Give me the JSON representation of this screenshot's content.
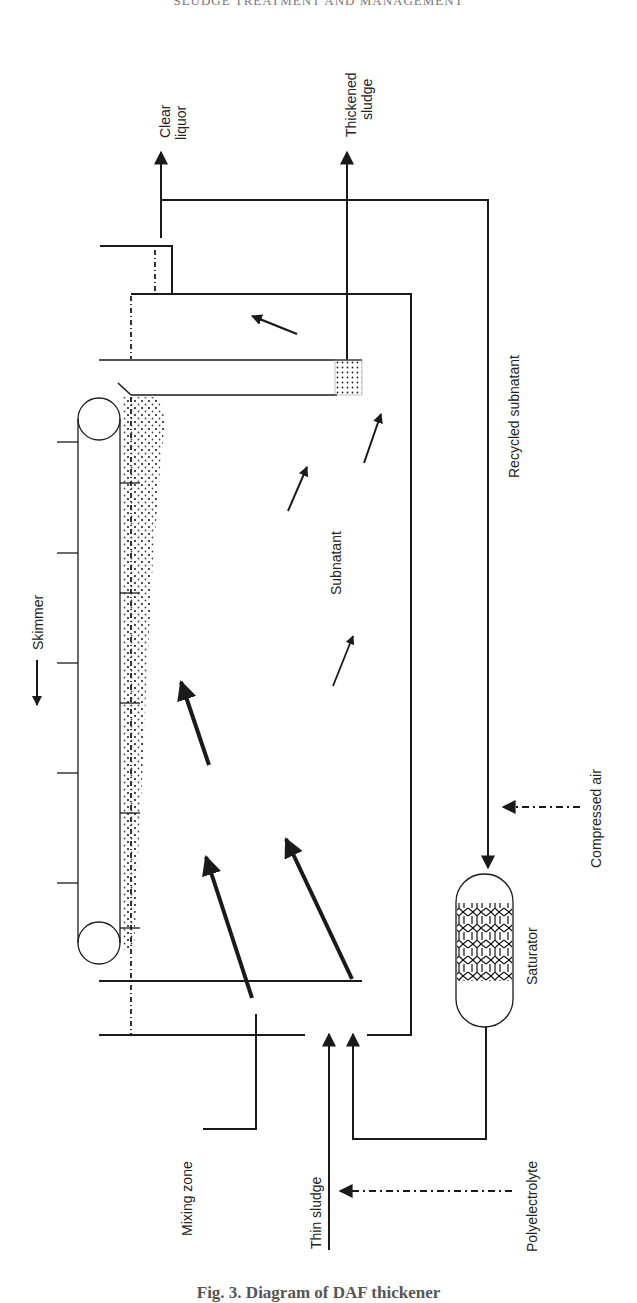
{
  "page": {
    "running_header": "SLUDGE TREATMENT AND MANAGEMENT",
    "caption": "Fig. 3. Diagram of DAF thickener"
  },
  "diagram": {
    "labels": {
      "clear_liquor_line1": "Clear",
      "clear_liquor_line2": "liquor",
      "thickened_sludge_line1": "Thickened",
      "thickened_sludge_line2": "sludge",
      "recycled_subnatant": "Recycled subnatant",
      "skimmer": "Skimmer",
      "subnatant": "Subnatant",
      "compressed_air": "Compressed air",
      "saturator": "Saturator",
      "mixing_zone": "Mixing zone",
      "thin_sludge": "Thin sludge",
      "polyelectrolyte": "Polyelectrolyte"
    },
    "colors": {
      "line": "#1a1a1a",
      "background": "#ffffff"
    },
    "orientation": "rotated 90deg counter-clockwise"
  }
}
